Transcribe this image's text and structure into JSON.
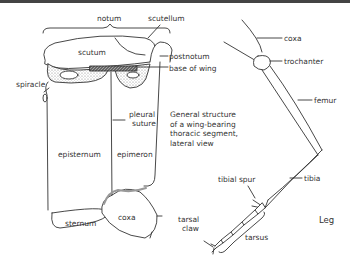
{
  "labels": {
    "notum": "notum",
    "scutellum": "scutellum",
    "scutum": "scutum",
    "postnotum": "postnotum",
    "base_of_wing": "base of wing",
    "spiracle": "spiracle",
    "pleural_suture_1": "pleural",
    "pleural_suture_2": "suture",
    "episternum": "episternum",
    "epimeron": "epimeron",
    "sternum": "sternum",
    "coxa_thorax": "coxa",
    "leg_coxa": "coxa",
    "trochanter": "trochanter",
    "femur": "femur",
    "tibial_spur": "tibial spur",
    "tibia": "tibia",
    "tarsal_claw_1": "tarsal",
    "tarsal_claw_2": "claw",
    "tarsus": "tarsus"
  },
  "caption": {
    "line1": "General structure",
    "line2": "of a wing-bearing",
    "line3": "thoracic segment,",
    "line4": "lateral view"
  },
  "leg_title": "Leg",
  "colors": {
    "stroke": "#333333",
    "stipple": "#bbbbbb",
    "topbar": "#444444"
  }
}
